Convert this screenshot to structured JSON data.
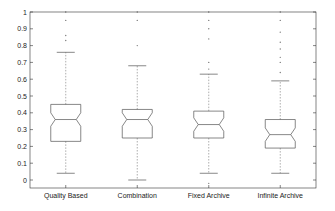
{
  "chart_data": {
    "type": "boxplot",
    "title": "",
    "xlabel": "",
    "ylabel": "",
    "ylim": [
      -0.05,
      1.0
    ],
    "yticks": [
      0,
      0.1,
      0.2,
      0.3,
      0.4,
      0.5,
      0.6,
      0.7,
      0.8,
      0.9,
      1
    ],
    "ytick_labels": [
      "0",
      "0.1",
      "0.2",
      "0.3",
      "0.4",
      "0.5",
      "0.6",
      "0.7",
      "0.8",
      "0.9",
      "1"
    ],
    "grid": false,
    "notched": true,
    "categories": [
      "Quality Based",
      "Combination",
      "Fixed Archive",
      "Infinite Archive"
    ],
    "series": [
      {
        "name": "Quality Based",
        "whisker_low": 0.04,
        "q1": 0.23,
        "median": 0.36,
        "q3": 0.45,
        "whisker_high": 0.76,
        "outliers": [
          0.83,
          0.86,
          0.95,
          1.0
        ]
      },
      {
        "name": "Combination",
        "whisker_low": 0.0,
        "q1": 0.25,
        "median": 0.36,
        "q3": 0.42,
        "whisker_high": 0.68,
        "outliers": [
          0.8,
          0.95,
          1.0
        ]
      },
      {
        "name": "Fixed Archive",
        "whisker_low": 0.04,
        "q1": 0.25,
        "median": 0.33,
        "q3": 0.41,
        "whisker_high": 0.63,
        "outliers": [
          -0.02,
          0.66,
          0.7,
          0.84,
          0.9,
          0.95,
          1.0
        ]
      },
      {
        "name": "Infinite Archive",
        "whisker_low": 0.04,
        "q1": 0.19,
        "median": 0.27,
        "q3": 0.36,
        "whisker_high": 0.59,
        "outliers": [
          0.64,
          0.7,
          0.73,
          0.78,
          0.82,
          0.88,
          0.95,
          1.0
        ]
      }
    ],
    "colors": {
      "box": "#555555",
      "whisker": "#777777",
      "axis": "#333333"
    }
  }
}
